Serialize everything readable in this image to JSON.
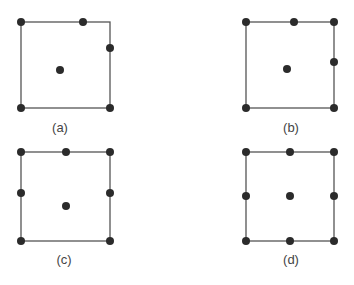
{
  "colors": {
    "edge": "#555555",
    "node": "#2b2b2b",
    "caption": "#444444",
    "background": "#ffffff"
  },
  "panels": [
    {
      "caption": "(a)",
      "square": {
        "x1": 21,
        "y1": 22,
        "x2": 110,
        "y2": 108
      },
      "nodes": [
        [
          21,
          22
        ],
        [
          83,
          22
        ],
        [
          110,
          48
        ],
        [
          60,
          70
        ],
        [
          21,
          108
        ],
        [
          110,
          108
        ]
      ],
      "caption_pos": [
        60,
        128
      ]
    },
    {
      "caption": "(b)",
      "square": {
        "x1": 246,
        "y1": 22,
        "x2": 334,
        "y2": 108
      },
      "nodes": [
        [
          246,
          22
        ],
        [
          294,
          22
        ],
        [
          334,
          22
        ],
        [
          334,
          62
        ],
        [
          287,
          69
        ],
        [
          246,
          108
        ],
        [
          334,
          108
        ]
      ],
      "caption_pos": [
        291,
        128
      ]
    },
    {
      "caption": "(c)",
      "square": {
        "x1": 21,
        "y1": 152,
        "x2": 110,
        "y2": 241
      },
      "nodes": [
        [
          21,
          152
        ],
        [
          66,
          152
        ],
        [
          110,
          152
        ],
        [
          21,
          193
        ],
        [
          110,
          193
        ],
        [
          66,
          206
        ],
        [
          21,
          241
        ],
        [
          110,
          241
        ]
      ],
      "caption_pos": [
        64,
        260
      ]
    },
    {
      "caption": "(d)",
      "square": {
        "x1": 246,
        "y1": 152,
        "x2": 334,
        "y2": 241
      },
      "nodes": [
        [
          246,
          152
        ],
        [
          290,
          152
        ],
        [
          334,
          152
        ],
        [
          246,
          196
        ],
        [
          290,
          196
        ],
        [
          334,
          196
        ],
        [
          246,
          241
        ],
        [
          290,
          241
        ],
        [
          334,
          241
        ]
      ],
      "caption_pos": [
        291,
        260
      ]
    }
  ]
}
